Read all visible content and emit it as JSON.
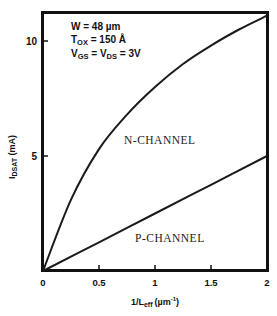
{
  "chart_data": {
    "type": "line",
    "title": "",
    "xlabel": "1/L_eff (µm^-1)",
    "xlabel_main": "1/L",
    "xlabel_sub": "eff",
    "xlabel_unit": "(µm",
    "xlabel_unit_sup": "-1",
    "xlabel_unit_close": ")",
    "ylabel": "I_DSAT (mA)",
    "ylabel_main": "I",
    "ylabel_sub": "DSAT",
    "ylabel_unit": " (mA)",
    "xlim": [
      0,
      2
    ],
    "ylim": [
      0,
      11.25
    ],
    "x_ticks": [
      0,
      0.5,
      1,
      1.5,
      2
    ],
    "x_tick_labels": [
      "0",
      "0.5",
      "1",
      "1.5",
      "2"
    ],
    "y_ticks": [
      5,
      10
    ],
    "y_tick_labels": [
      "5",
      "10"
    ],
    "grid": false,
    "legend": "inline curve labels",
    "series": [
      {
        "name": "N-CHANNEL",
        "x": [
          0,
          0.25,
          0.5,
          0.75,
          1.0,
          1.25,
          1.5,
          1.75,
          2.0
        ],
        "values": [
          0,
          3.1,
          5.3,
          6.8,
          8.0,
          9.0,
          9.8,
          10.5,
          11.1
        ]
      },
      {
        "name": "P-CHANNEL",
        "x": [
          0,
          0.5,
          1.0,
          1.5,
          2.0
        ],
        "values": [
          0,
          1.25,
          2.5,
          3.75,
          5.0
        ]
      }
    ],
    "annotations": [
      {
        "text": "W = 48 µm",
        "main": "W = 48 µm"
      },
      {
        "text": "T_OX = 150 Å",
        "main": "T",
        "sub": "OX",
        "rest": " = 150 Å"
      },
      {
        "text": "V_GS = V_DS = 3V",
        "main": "V",
        "sub": "GS",
        "mid": " = V",
        "sub2": "DS",
        "rest": " = 3V"
      }
    ]
  }
}
